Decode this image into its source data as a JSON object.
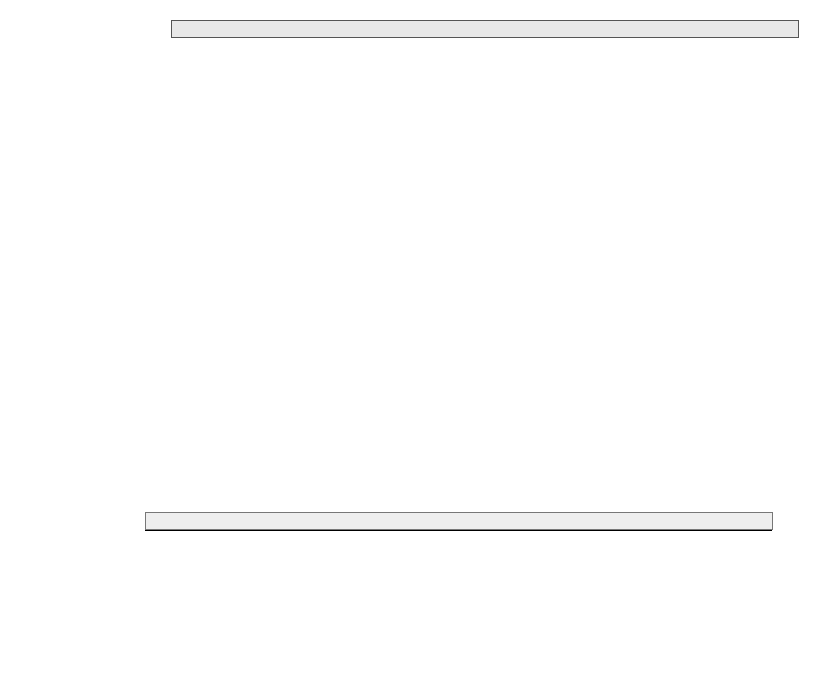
{
  "chart_data": {
    "type": "bar",
    "subtype": "stacked-horizontal-100-percent-3d",
    "title": "",
    "xlabel": "",
    "ylabel": "",
    "xlim": [
      0,
      100
    ],
    "xtick_labels": [
      "0%",
      "10%",
      "20%",
      "30%",
      "40%",
      "50%",
      "60%",
      "70%",
      "80%",
      "90%",
      "100%"
    ],
    "xticks": [
      0,
      10,
      20,
      30,
      40,
      50,
      60,
      70,
      80,
      90,
      100
    ],
    "grid": false,
    "legend_position": "bottom",
    "categories": [
      "SchülerInnen gesamt",
      "Ausl. Sch.",
      "Sonstige",
      "Portugal",
      "Jugoslawien",
      "Türkei",
      "Spanien",
      "Italien",
      "Griechenland"
    ],
    "series": [
      {
        "name": "Lernbehinderten-\nschulen",
        "name_flat": "Lernbehindertenschulen",
        "color": "#9b9b9b",
        "values": [
          1.0,
          3.2,
          2.8,
          3.0,
          4.0,
          3.8,
          3.6,
          4.2,
          3.6
        ]
      },
      {
        "name": "Sonstige\nSonderschulen",
        "name_flat": "Sonstige Sonderschulen",
        "color": "#161616",
        "values": [
          3.7,
          2.3,
          2.0,
          2.0,
          2.6,
          2.4,
          2.2,
          2.6,
          2.6
        ]
      },
      {
        "name": "Grundschulen",
        "name_flat": "Grundschulen",
        "color": "#ffffff",
        "values": [
          44.0,
          45.4,
          43.8,
          43.6,
          44.8,
          46.8,
          34.2,
          43.2,
          35.8
        ]
      },
      {
        "name": "Hauptschulen",
        "name_flat": "Hauptschulen",
        "color": "#d6d6d6",
        "values": [
          12.9,
          23.3,
          18.5,
          24.1,
          26.4,
          24.0,
          17.0,
          22.0,
          23.0
        ]
      },
      {
        "name": "Realschulen",
        "name_flat": "Realschulen",
        "color": "#101010",
        "values": [
          14.4,
          9.0,
          9.1,
          11.1,
          9.7,
          8.3,
          14.0,
          8.0,
          14.0
        ]
      },
      {
        "name": "Gymnasien",
        "name_flat": "Gymnasien",
        "color": "#b4b4b4",
        "values": [
          18.5,
          9.6,
          16.4,
          10.6,
          8.0,
          6.5,
          17.0,
          9.0,
          13.0
        ]
      },
      {
        "name": "Gesamtschulen",
        "name_flat": "Gesamtschulen",
        "color": "#5d5d5d",
        "values": [
          5.5,
          7.2,
          7.4,
          5.6,
          4.5,
          8.2,
          12.0,
          11.0,
          8.0
        ]
      }
    ]
  },
  "legend": {
    "items": [
      {
        "label": "Lernbehinderten-\nschulen",
        "swatch": "lern"
      },
      {
        "label": "Grundschulen",
        "swatch": "grund"
      },
      {
        "label": "Realschulen",
        "swatch": "real"
      },
      {
        "label": "Gesamtschulen",
        "swatch": "ges"
      },
      {
        "label": "Sonstige\nSonderschulen",
        "swatch": "sonst"
      },
      {
        "label": "Hauptschulen",
        "swatch": "haupt"
      },
      {
        "label": "Gymnasien",
        "swatch": "gymn"
      }
    ]
  }
}
